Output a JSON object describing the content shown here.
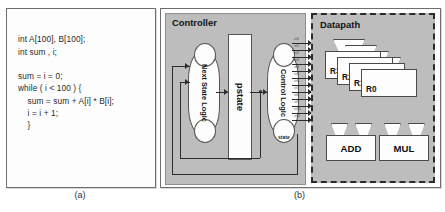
{
  "figure": {
    "panel_a": {
      "caption": "(a)",
      "code": "int A[100], B[100];\nint sum , i;\n\nsum = i = 0;\nwhile ( i < 100 ) {\n    sum = sum + A[i] * B[i];\n    i = i + 1;\n    }"
    },
    "panel_b": {
      "caption": "(b)",
      "controller": {
        "title": "Controller",
        "next_state_logic": "Next State\nLogic",
        "pstate": "pstate",
        "control_logic": "Control\nLogic",
        "state_signal": "state"
      },
      "datapath": {
        "title": "Datapath",
        "registers": [
          {
            "label": "R3"
          },
          {
            "label": "R2"
          },
          {
            "label": "R1"
          },
          {
            "label": "R0"
          }
        ],
        "functional_units": [
          {
            "label": "ADD"
          },
          {
            "label": "MUL"
          }
        ],
        "control_signals": [
          "ctrl0",
          "ctrl1",
          "ctrl2",
          "ctrl3",
          "ctrl4",
          "ctrl5",
          "ctrl6",
          "ctrl7",
          "ctrl8",
          "ctrl9",
          "ctrl10",
          "ctrl11"
        ]
      }
    }
  },
  "colors": {
    "panel_background": "#fdfdfd",
    "block_fill": "#bdbdbd",
    "line": "#2b2b2b",
    "text": "#111111"
  }
}
